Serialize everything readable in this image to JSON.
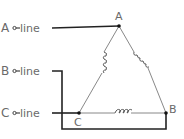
{
  "diagram": {
    "type": "delta-connection",
    "lines": [
      {
        "id": "A",
        "prefix": "A",
        "label": "line"
      },
      {
        "id": "B",
        "prefix": "B",
        "label": "line"
      },
      {
        "id": "C",
        "prefix": "C",
        "label": "line"
      }
    ],
    "vertices": [
      {
        "id": "A",
        "label": "A"
      },
      {
        "id": "B",
        "label": "B"
      },
      {
        "id": "C",
        "label": "C"
      }
    ],
    "colors": {
      "wire": "#222222",
      "label": "#6a6a6a",
      "winding": "#555555"
    }
  }
}
